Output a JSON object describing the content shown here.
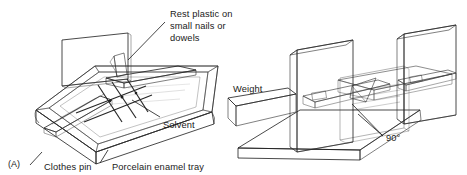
{
  "figure": {
    "background_color": "#ffffff",
    "ink_color": "#1a1a1a",
    "panels": [
      {
        "id": "(A)",
        "name": "solvent-tray-panel",
        "labels": [
          {
            "key": "rest_plastic",
            "lines": [
              "Rest plastic on",
              "small nails or",
              "dowels"
            ]
          },
          {
            "key": "solvent",
            "text": "Solvent"
          },
          {
            "key": "clothes_pin",
            "text": "Clothes pin"
          },
          {
            "key": "porcelain_tray",
            "text": "Porcelain enamel tray"
          }
        ]
      },
      {
        "id": "",
        "name": "right-angle-jig-panel",
        "labels": [
          {
            "key": "weight",
            "text": "Weight"
          },
          {
            "key": "angle",
            "text": "90°"
          }
        ]
      }
    ],
    "text": {
      "rest_plastic_l1": "Rest plastic on",
      "rest_plastic_l2": "small nails or",
      "rest_plastic_l3": "dowels",
      "solvent": "Solvent",
      "clothes_pin": "Clothes pin",
      "porcelain_tray": "Porcelain enamel tray",
      "panel_a": "(A)",
      "weight": "Weight",
      "angle": "90°"
    },
    "colors": {
      "tray_rim_top": "#d8d6d1",
      "tray_rim_shadow": "#6f6d69",
      "tray_inner": "#f2f1ee",
      "solvent_fill": "#e6e5e1",
      "speckle_dark": "#4b4845",
      "block_face_light": "#cfccc6",
      "block_face_mid": "#a9a6a0",
      "block_face_dark": "#55524e",
      "weight_dark": "#39372f",
      "line": "#1c1c1c"
    }
  }
}
